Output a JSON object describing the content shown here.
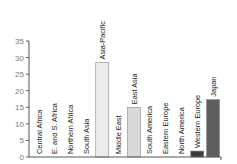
{
  "chart_data": {
    "type": "bar",
    "title": "",
    "xlabel": "",
    "ylabel": "",
    "ylim": [
      0,
      35
    ],
    "yticks": [
      0,
      5,
      10,
      15,
      20,
      25,
      30,
      35
    ],
    "grid": false,
    "legend": null,
    "categories": [
      "Central Africa",
      "E. and S. Africa",
      "Northern Africa",
      "South Asia",
      "Asia-Pacific",
      "Middle East",
      "East Asia",
      "South America",
      "Eastern Europe",
      "North America",
      "Western Europe",
      "Japan"
    ],
    "values": [
      0,
      0,
      0,
      0,
      28.5,
      0,
      15,
      0,
      0,
      0,
      1.8,
      17.3
    ],
    "colors": [
      "#ffffff",
      "#ffffff",
      "#ffffff",
      "#ffffff",
      "#ececec",
      "#ffffff",
      "#d9d9d9",
      "#ffffff",
      "#ffffff",
      "#ffffff",
      "#3c3c3c",
      "#5e5e5e"
    ]
  }
}
